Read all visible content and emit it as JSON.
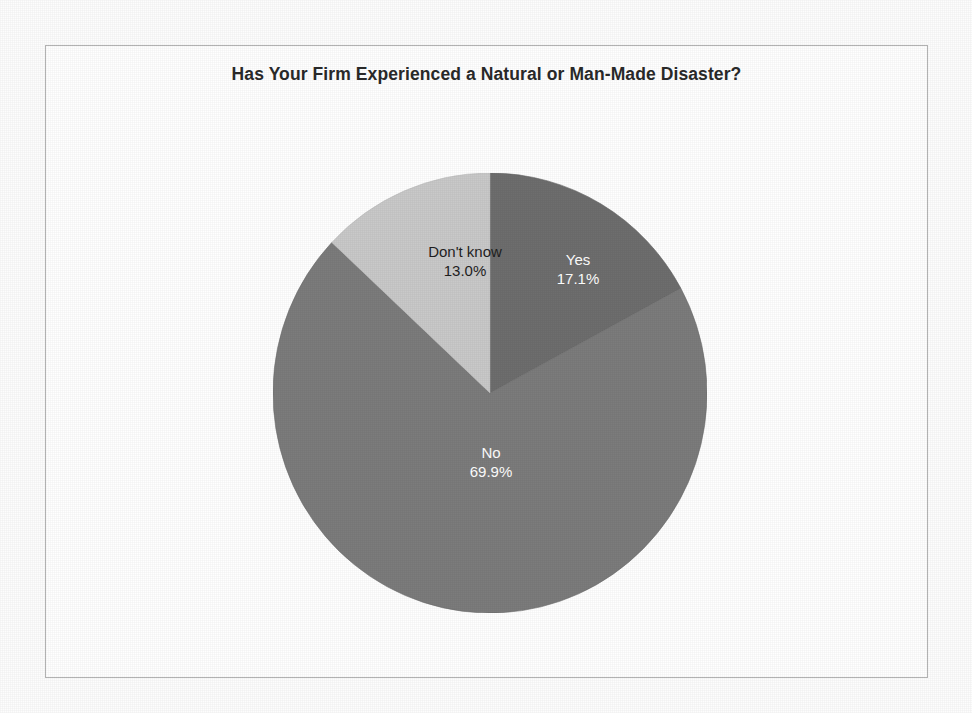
{
  "chart_data": {
    "type": "pie",
    "title": "Has Your Firm Experienced a Natural or Man-Made Disaster?",
    "categories": [
      "Yes",
      "No",
      "Don't know"
    ],
    "values": [
      17.1,
      69.9,
      13.0
    ],
    "value_suffix": "%",
    "labels": [
      {
        "name": "Yes",
        "value": "17.1%",
        "color": "#6e6e6e",
        "text_color": "#ffffff"
      },
      {
        "name": "No",
        "value": "69.9%",
        "color": "#7c7c7c",
        "text_color": "#ffffff"
      },
      {
        "name": "Don't know",
        "value": "13.0%",
        "color": "#c9c9c9",
        "text_color": "#1f1f1f"
      }
    ],
    "start_angle_deg": 0,
    "direction": "clockwise",
    "legend": "none",
    "grid": false,
    "border_color": "#b4b4b4",
    "background": "#ffffff"
  }
}
